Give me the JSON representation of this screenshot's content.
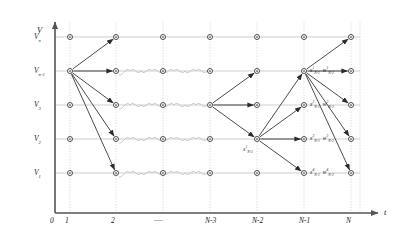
{
  "figure": {
    "type": "trellis-diagram",
    "axes": {
      "y_axis_name": "V",
      "x_axis_name": "t",
      "origin_label": "0"
    },
    "y_ticks": [
      {
        "text": "V",
        "sub": "n"
      },
      {
        "text": "V",
        "sub": "n-1"
      },
      {
        "text": "V",
        "sub": "3"
      },
      {
        "text": "V",
        "sub": "2"
      },
      {
        "text": "V",
        "sub": "1"
      }
    ],
    "x_ticks": [
      "1",
      "2",
      "......",
      "N-3",
      "N-2",
      "N-1",
      "N"
    ],
    "annotations": [
      {
        "id": "a1",
        "x": "x",
        "xsup": "1",
        "xsub": "N-1",
        "w": "w",
        "wsup": "1",
        "wsub": "N-2"
      },
      {
        "id": "a2",
        "x": "x",
        "xsup": "2",
        "xsub": "N-1",
        "w": "w",
        "wsup": "2",
        "wsub": "N-2"
      },
      {
        "id": "a3",
        "x": "x",
        "xsup": "3",
        "xsub": "N-1",
        "w": "w",
        "wsup": "3",
        "wsub": "N-2"
      },
      {
        "id": "a4",
        "x": "x",
        "xsup": "4",
        "xsub": "N-1",
        "w": "w",
        "wsup": "4",
        "wsub": "N-2"
      },
      {
        "id": "a5",
        "x": "x",
        "xsup": "1",
        "xsub": "N-2",
        "w": "",
        "wsup": "",
        "wsub": ""
      }
    ],
    "colors": {
      "grid": "#b9b9b9",
      "grid_dotted": "#c9c9c9",
      "node_stroke": "#3a3a3a",
      "node_fill": "#ffffff",
      "edge": "#2b2b2b",
      "wave": "#bdbdbd",
      "axis": "#555555",
      "text": "#1a1a1a"
    },
    "chart_data": {
      "type": "scatter",
      "title": "",
      "xlabel": "t",
      "ylabel": "V",
      "x_categories": [
        "0",
        "1",
        "2",
        "......",
        "N-3",
        "N-2",
        "N-1",
        "N"
      ],
      "y_categories": [
        "V_1",
        "V_2",
        "V_3",
        "V_n-1",
        "V_n"
      ],
      "columns_px": [
        55,
        70,
        116,
        163,
        210,
        257,
        304,
        351
      ],
      "rows_px": [
        37,
        71,
        105,
        139,
        173
      ],
      "grid": true,
      "legend": "none",
      "nodes": [
        {
          "col": 1,
          "row": 0
        },
        {
          "col": 1,
          "row": 1
        },
        {
          "col": 1,
          "row": 2
        },
        {
          "col": 1,
          "row": 3
        },
        {
          "col": 1,
          "row": 4
        },
        {
          "col": 2,
          "row": 0
        },
        {
          "col": 2,
          "row": 1
        },
        {
          "col": 2,
          "row": 2
        },
        {
          "col": 2,
          "row": 3
        },
        {
          "col": 2,
          "row": 4
        },
        {
          "col": 3,
          "row": 0
        },
        {
          "col": 3,
          "row": 1
        },
        {
          "col": 3,
          "row": 2
        },
        {
          "col": 3,
          "row": 3
        },
        {
          "col": 3,
          "row": 4
        },
        {
          "col": 4,
          "row": 0
        },
        {
          "col": 4,
          "row": 1
        },
        {
          "col": 4,
          "row": 2
        },
        {
          "col": 4,
          "row": 3
        },
        {
          "col": 4,
          "row": 4
        },
        {
          "col": 5,
          "row": 0
        },
        {
          "col": 5,
          "row": 1
        },
        {
          "col": 5,
          "row": 2
        },
        {
          "col": 5,
          "row": 3
        },
        {
          "col": 5,
          "row": 4
        },
        {
          "col": 6,
          "row": 0
        },
        {
          "col": 6,
          "row": 1
        },
        {
          "col": 6,
          "row": 2
        },
        {
          "col": 6,
          "row": 3
        },
        {
          "col": 6,
          "row": 4
        },
        {
          "col": 7,
          "row": 0
        },
        {
          "col": 7,
          "row": 1
        },
        {
          "col": 7,
          "row": 2
        },
        {
          "col": 7,
          "row": 3
        },
        {
          "col": 7,
          "row": 4
        }
      ],
      "edges": [
        {
          "from": [
            1,
            1
          ],
          "to": [
            2,
            0
          ]
        },
        {
          "from": [
            1,
            1
          ],
          "to": [
            2,
            1
          ]
        },
        {
          "from": [
            1,
            1
          ],
          "to": [
            2,
            2
          ]
        },
        {
          "from": [
            1,
            1
          ],
          "to": [
            2,
            3
          ]
        },
        {
          "from": [
            1,
            1
          ],
          "to": [
            2,
            4
          ]
        },
        {
          "from": [
            4,
            2
          ],
          "to": [
            5,
            1
          ]
        },
        {
          "from": [
            4,
            2
          ],
          "to": [
            5,
            2
          ]
        },
        {
          "from": [
            4,
            2
          ],
          "to": [
            5,
            3
          ]
        },
        {
          "from": [
            5,
            3
          ],
          "to": [
            6,
            1
          ]
        },
        {
          "from": [
            5,
            3
          ],
          "to": [
            6,
            2
          ]
        },
        {
          "from": [
            5,
            3
          ],
          "to": [
            6,
            3
          ]
        },
        {
          "from": [
            5,
            3
          ],
          "to": [
            6,
            4
          ]
        },
        {
          "from": [
            6,
            1
          ],
          "to": [
            7,
            0
          ]
        },
        {
          "from": [
            6,
            1
          ],
          "to": [
            7,
            1
          ]
        },
        {
          "from": [
            6,
            1
          ],
          "to": [
            7,
            2
          ]
        },
        {
          "from": [
            6,
            1
          ],
          "to": [
            7,
            3
          ]
        },
        {
          "from": [
            6,
            1
          ],
          "to": [
            7,
            4
          ]
        }
      ],
      "wave_rows": [
        1,
        2,
        3,
        4
      ],
      "wave_span_cols": [
        2,
        4
      ]
    }
  }
}
